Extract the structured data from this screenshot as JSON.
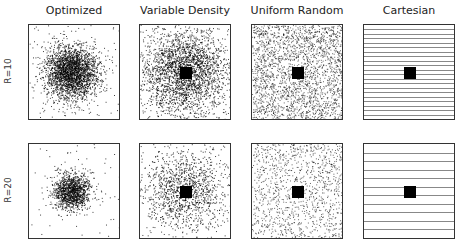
{
  "figure": {
    "columns": [
      {
        "key": "optimized",
        "label": "Optimized",
        "x": 28
      },
      {
        "key": "vd",
        "label": "Variable Density",
        "x": 139
      },
      {
        "key": "uniform",
        "label": "Uniform Random",
        "x": 251
      },
      {
        "key": "cartesian",
        "label": "Cartesian",
        "x": 363
      }
    ],
    "rows": [
      {
        "label": "R=10",
        "y": 24,
        "density": 1.0,
        "cart_lines": 20
      },
      {
        "label": "R=20",
        "y": 143,
        "density": 0.5,
        "cart_lines": 10
      }
    ]
  }
}
